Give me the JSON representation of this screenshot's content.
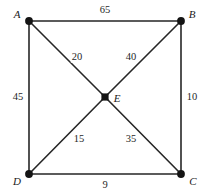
{
  "figure": {
    "type": "weighted-graph-diagram",
    "width": 205,
    "height": 196,
    "background_color": "#ffffff",
    "stroke_color": "#262626",
    "text_color": "#1a1a1a"
  },
  "vertices": [
    {
      "id": "A",
      "label": "A",
      "x": 29,
      "y": 21,
      "label_x": 17,
      "label_y": 14,
      "shape": "circle"
    },
    {
      "id": "B",
      "label": "B",
      "x": 181,
      "y": 21,
      "label_x": 192,
      "label_y": 14,
      "shape": "circle"
    },
    {
      "id": "C",
      "label": "C",
      "x": 181,
      "y": 174,
      "label_x": 193,
      "label_y": 181,
      "shape": "circle"
    },
    {
      "id": "D",
      "label": "D",
      "x": 29,
      "y": 174,
      "label_x": 17,
      "label_y": 181,
      "shape": "circle"
    },
    {
      "id": "E",
      "label": "E",
      "x": 105,
      "y": 97,
      "label_x": 117,
      "label_y": 98,
      "shape": "square"
    }
  ],
  "edges": [
    {
      "id": "AB",
      "from": "A",
      "to": "B",
      "weight": "65",
      "label_x": 105,
      "label_y": 10
    },
    {
      "id": "AD",
      "from": "A",
      "to": "D",
      "weight": "45",
      "label_x": 18,
      "label_y": 97
    },
    {
      "id": "BC",
      "from": "B",
      "to": "C",
      "weight": "10",
      "label_x": 192,
      "label_y": 97
    },
    {
      "id": "DC",
      "from": "D",
      "to": "C",
      "weight": "9",
      "label_x": 105,
      "label_y": 185
    },
    {
      "id": "AE",
      "from": "A",
      "to": "E",
      "weight": "20",
      "label_x": 77,
      "label_y": 57
    },
    {
      "id": "BE",
      "from": "B",
      "to": "E",
      "weight": "40",
      "label_x": 131,
      "label_y": 57
    },
    {
      "id": "DE",
      "from": "D",
      "to": "E",
      "weight": "15",
      "label_x": 79,
      "label_y": 139
    },
    {
      "id": "CE",
      "from": "C",
      "to": "E",
      "weight": "35",
      "label_x": 131,
      "label_y": 139
    }
  ]
}
